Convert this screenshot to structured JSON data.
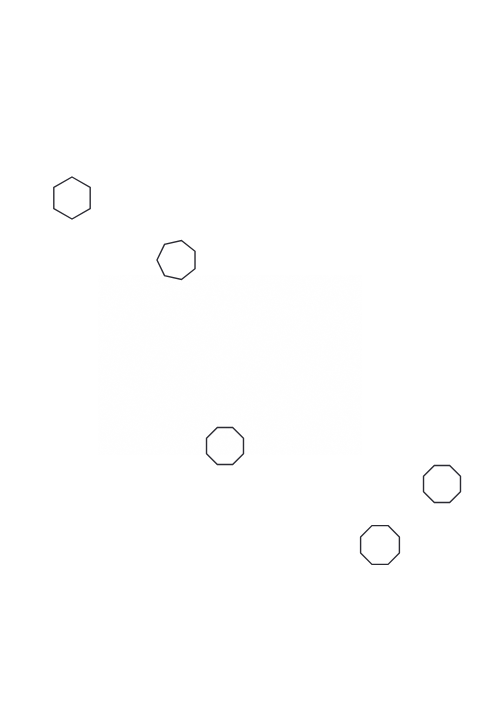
{
  "canvas": {
    "width": 498,
    "height": 718,
    "background_color": "#ffffff",
    "description": "Plain white field containing five unfilled polygon outlines"
  },
  "style": {
    "stroke_color": "#2b2b33",
    "stroke_width": 1.4,
    "fill": "none"
  },
  "shapes": [
    {
      "id": "shape-1",
      "name": "hexagon",
      "sides": 6,
      "center_x": 72,
      "center_y": 198,
      "radius": 21,
      "rotation_deg": 0,
      "bbox": {
        "x": 52,
        "y": 178,
        "width": 42,
        "height": 39
      },
      "orientation": "flat-top, pointed left and right vertices"
    },
    {
      "id": "shape-2",
      "name": "heptagon",
      "sides": 7,
      "center_x": 177,
      "center_y": 260,
      "radius": 20,
      "rotation_deg": -90,
      "bbox": {
        "x": 158,
        "y": 240,
        "width": 38,
        "height": 39
      },
      "orientation": "vertex pointing up"
    },
    {
      "id": "shape-3",
      "name": "octagon",
      "sides": 8,
      "center_x": 225,
      "center_y": 446,
      "radius": 20,
      "rotation_deg": 22.5,
      "bbox": {
        "x": 206,
        "y": 427,
        "width": 38,
        "height": 38
      },
      "orientation": "flat-top"
    },
    {
      "id": "shape-4",
      "name": "octagon",
      "sides": 8,
      "center_x": 442,
      "center_y": 484,
      "radius": 20,
      "rotation_deg": 22.5,
      "bbox": {
        "x": 423,
        "y": 465,
        "width": 38,
        "height": 38
      },
      "orientation": "flat-top"
    },
    {
      "id": "shape-5",
      "name": "octagon",
      "sides": 8,
      "center_x": 380,
      "center_y": 545,
      "radius": 21,
      "rotation_deg": 22.5,
      "bbox": {
        "x": 360,
        "y": 525,
        "width": 40,
        "height": 40
      },
      "orientation": "flat-top"
    }
  ],
  "summary": {
    "shape_count": 5,
    "counts_by_type": {
      "hexagon": 1,
      "heptagon": 1,
      "octagon": 3
    }
  }
}
